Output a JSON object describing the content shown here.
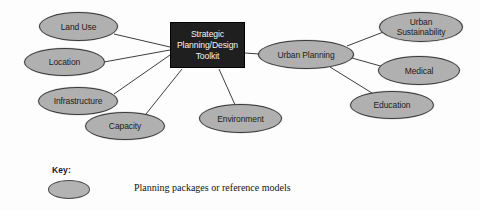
{
  "diagram": {
    "center": {
      "lines": [
        "Strategic",
        "Planning/Design",
        "Toolkit"
      ]
    },
    "left_nodes": [
      {
        "id": "land-use",
        "label": "Land Use",
        "x": 39,
        "y": 12,
        "w": 79,
        "h": 29
      },
      {
        "id": "location",
        "label": "Location",
        "x": 24,
        "y": 48,
        "w": 81,
        "h": 28
      },
      {
        "id": "infrastructure",
        "label": "Infrastructure",
        "x": 38,
        "y": 87,
        "w": 80,
        "h": 28
      },
      {
        "id": "capacity",
        "label": "Capacity",
        "x": 85,
        "y": 112,
        "w": 80,
        "h": 28
      },
      {
        "id": "environment",
        "label": "Environment",
        "x": 199,
        "y": 104,
        "w": 83,
        "h": 29
      }
    ],
    "hub": {
      "id": "urban-planning",
      "label": "Urban Planning",
      "x": 258,
      "y": 40,
      "w": 96,
      "h": 29
    },
    "right_nodes": [
      {
        "id": "urban-sustainability",
        "label": "Urban\nSustainability",
        "x": 379,
        "y": 12,
        "w": 84,
        "h": 30
      },
      {
        "id": "medical",
        "label": "Medical",
        "x": 378,
        "y": 56,
        "w": 82,
        "h": 29
      },
      {
        "id": "education",
        "label": "Education",
        "x": 350,
        "y": 91,
        "w": 84,
        "h": 28
      }
    ]
  },
  "key": {
    "title": "Key:",
    "description": "Planning packages or reference models"
  },
  "colors": {
    "node_fill": "#b0b0b0",
    "node_stroke": "#3a3a3a",
    "center_fill": "#201f1f",
    "center_text": "#f2f2f2",
    "edge_stroke": "#3d3d3d",
    "background": "#fdfdfd"
  }
}
